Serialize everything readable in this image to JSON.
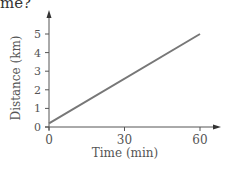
{
  "question_fragment": "me?",
  "chart_data": {
    "type": "line",
    "title": "",
    "xlabel": "Time (min)",
    "ylabel": "Distance (km)",
    "x_ticks": [
      0,
      30,
      60
    ],
    "y_ticks": [
      0,
      1,
      2,
      3,
      4,
      5
    ],
    "xlim": [
      0,
      60
    ],
    "ylim": [
      0,
      5
    ],
    "grid": false,
    "series": [
      {
        "name": "distance",
        "x": [
          0,
          60
        ],
        "y": [
          0.2,
          5
        ],
        "color": "#777777"
      }
    ]
  }
}
